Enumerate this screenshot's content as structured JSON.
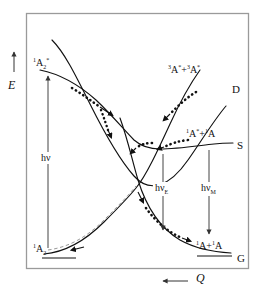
{
  "figure": {
    "type": "potential-energy-diagram",
    "axes": {
      "y_label": "E",
      "y_arrow_direction": "up",
      "x_label": "Q",
      "x_arrow_direction": "left"
    },
    "frame": {
      "color": "#9a9a9a"
    },
    "curve_color": "#111111",
    "states": [
      {
        "id": "D",
        "end_label": "D",
        "state_label_parts": [
          "3",
          "A",
          "*",
          " + ",
          "3",
          "A",
          "*"
        ],
        "state_label_plain": "3A* + 3A*"
      },
      {
        "id": "S",
        "end_label": "S",
        "state_label_parts": [
          "1",
          "A",
          "*",
          " + ",
          "1",
          "A"
        ],
        "state_label_plain": "1A* + 1A"
      },
      {
        "id": "G",
        "end_label": "G",
        "state_label_parts": [
          "1",
          "A",
          " + ",
          "1",
          "A"
        ],
        "state_label_plain": "1A + 1A"
      },
      {
        "id": "A2star",
        "end_label": "",
        "state_label_plain": "1A2*"
      },
      {
        "id": "A2",
        "end_label": "",
        "state_label_plain": "1A2"
      }
    ],
    "transitions": [
      {
        "id": "absorption",
        "label_plain": "hv",
        "label_main": "h",
        "label_nu": "ν",
        "label_sub": "",
        "direction": "up"
      },
      {
        "id": "excimer-emission",
        "label_plain": "hvE",
        "label_main": "h",
        "label_nu": "ν",
        "label_sub": "E",
        "direction": "down"
      },
      {
        "id": "monomer-emission",
        "label_plain": "hvM",
        "label_main": "h",
        "label_nu": "ν",
        "label_sub": "M",
        "direction": "down"
      }
    ],
    "labels": {
      "upper_left_state": {
        "pre_sup": "1",
        "base": "A",
        "sub": "2",
        "star": "*"
      },
      "lower_left_state": {
        "pre_sup": "1",
        "base": "A",
        "sub": "2",
        "star": ""
      },
      "dimer_state": {
        "sup1": "3",
        "base1": "A",
        "star1": "*",
        "plus": "+",
        "sup2": "3",
        "base2": "A",
        "star2": "*"
      },
      "excimer_state": {
        "sup1": "1",
        "base1": "A",
        "star1": "*",
        "plus": "+",
        "sup2": "1",
        "base2": "A",
        "star2": ""
      },
      "ground_state": {
        "sup1": "1",
        "base1": "A",
        "star1": "",
        "plus": "+",
        "sup2": "1",
        "base2": "A",
        "star2": ""
      },
      "curve_end_D": "D",
      "curve_end_S": "S",
      "curve_end_G": "G",
      "axis_E": "E",
      "axis_Q": "Q",
      "hv": "hν",
      "hv_E_main": "hν",
      "hv_E_sub": "E",
      "hv_M_main": "hν",
      "hv_M_sub": "M"
    }
  }
}
